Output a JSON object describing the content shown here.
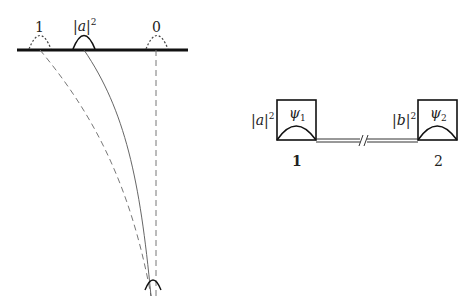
{
  "left_diagram": {
    "screen_labels": [
      {
        "id": "left",
        "text": "1"
      },
      {
        "id": "middle",
        "text": "|a|",
        "sup": "2"
      },
      {
        "id": "right",
        "text": "0"
      }
    ]
  },
  "right_diagram": {
    "box1": {
      "prob": "|a|",
      "prob_sup": "2",
      "psi": "ψ",
      "psi_sub": "1",
      "index": "1"
    },
    "box2": {
      "prob": "|b|",
      "prob_sup": "2",
      "psi": "ψ",
      "psi_sub": "2",
      "index": "2"
    }
  },
  "colors": {
    "stroke": "#222222",
    "dashed": "#777777"
  }
}
